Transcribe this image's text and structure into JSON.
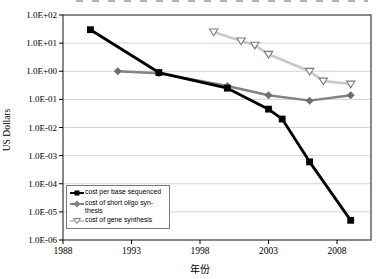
{
  "figure": {
    "ylabel": "US Dollars",
    "xlabel": "年份",
    "background": "#ffffff",
    "frame_color": "#3a3a3a",
    "grid_color": "#c9c9c9"
  },
  "legend": {
    "entries": [
      {
        "label": "cost per base sequenced",
        "marker": "filled-square",
        "color": "#000000"
      },
      {
        "label": "cost of short oligo syn-thesis",
        "marker": "filled-diamond",
        "color": "#828282"
      },
      {
        "label": "cost of gene synthesis",
        "marker": "open-triangle-down",
        "color": "#c3ccc3",
        "marker_edge": "#71816f"
      }
    ]
  },
  "chart_data": {
    "type": "line",
    "title": "",
    "xlabel": "年份",
    "ylabel": "US Dollars",
    "y_scale": "log",
    "ylim": [
      1e-06,
      100
    ],
    "xlim": [
      1988,
      2010.4
    ],
    "grid": "horizontal",
    "legend_position": "inside-bottom-left",
    "x_ticks": [
      1988,
      1993,
      1998,
      2003,
      2008
    ],
    "y_tick_labels": [
      "1.0E+02",
      "1.0E+01",
      "1.0E+00",
      "1.0E-01",
      "1.0E-02",
      "1.0E-03",
      "1.0E-04",
      "1.0E-05",
      "1.0E-06"
    ],
    "series": [
      {
        "name": "cost per base sequenced",
        "marker": "square",
        "color": "#000000",
        "marker_color": "#000000",
        "line_width": 2.8,
        "points": [
          [
            1990,
            30
          ],
          [
            1995,
            0.9
          ],
          [
            2000,
            0.25
          ],
          [
            2003,
            0.045
          ],
          [
            2004,
            0.02
          ],
          [
            2006,
            0.0006
          ],
          [
            2009,
            5e-06
          ]
        ]
      },
      {
        "name": "cost of short oligo synthesis",
        "marker": "diamond",
        "color": "#828282",
        "marker_color": "#6e6e6e",
        "line_width": 2.4,
        "points": [
          [
            1992,
            1.0
          ],
          [
            1995,
            0.85
          ],
          [
            2000,
            0.3
          ],
          [
            2003,
            0.14
          ],
          [
            2006,
            0.09
          ],
          [
            2009,
            0.14
          ]
        ]
      },
      {
        "name": "cost of gene synthesis",
        "marker": "triangle-down",
        "color": "#c3ccc3",
        "marker_color": "#71816f",
        "line_width": 2.6,
        "points": [
          [
            1999,
            25
          ],
          [
            2001,
            12
          ],
          [
            2002,
            8.5
          ],
          [
            2003,
            4
          ],
          [
            2006,
            1.0
          ],
          [
            2007,
            0.45
          ],
          [
            2009,
            0.35
          ]
        ]
      }
    ]
  }
}
